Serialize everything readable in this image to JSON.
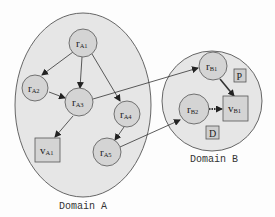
{
  "domains": [
    {
      "id": "A",
      "label": "Domain A"
    },
    {
      "id": "B",
      "label": "Domain B"
    }
  ],
  "nodes": {
    "rA1": {
      "main": "r",
      "sub": "A1"
    },
    "rA2": {
      "main": "r",
      "sub": "A2"
    },
    "rA3": {
      "main": "r",
      "sub": "A3"
    },
    "rA4": {
      "main": "r",
      "sub": "A4"
    },
    "rA5": {
      "main": "r",
      "sub": "A5"
    },
    "vA1": {
      "main": "v",
      "sub": "A1"
    },
    "rB1": {
      "main": "r",
      "sub": "B1"
    },
    "rB2": {
      "main": "r",
      "sub": "B2"
    },
    "vB1": {
      "main": "v",
      "sub": "B1"
    },
    "P": {
      "main": "P"
    },
    "D": {
      "main": "D"
    }
  },
  "edges": [
    {
      "from": "rA1",
      "to": "rA2",
      "style": "solid"
    },
    {
      "from": "rA1",
      "to": "rA3",
      "style": "solid"
    },
    {
      "from": "rA1",
      "to": "rA4",
      "style": "solid"
    },
    {
      "from": "rA2",
      "to": "rA3",
      "style": "solid"
    },
    {
      "from": "rA3",
      "to": "vA1",
      "style": "solid"
    },
    {
      "from": "rA4",
      "to": "rA5",
      "style": "solid"
    },
    {
      "from": "rA3",
      "to": "rB1",
      "style": "solid"
    },
    {
      "from": "rA5",
      "to": "rB2",
      "style": "solid"
    },
    {
      "from": "rB1",
      "to": "vB1",
      "style": "bold"
    },
    {
      "from": "rB2",
      "to": "vB1",
      "style": "dotted-bold"
    }
  ],
  "colors": {
    "domain_fill": "#e6e6e6",
    "node_fill": "#d4d4d4",
    "stroke": "#555555"
  }
}
